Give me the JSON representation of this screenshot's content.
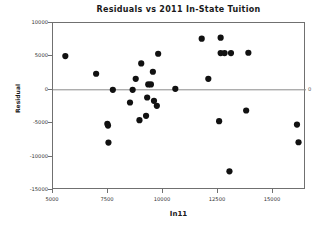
{
  "chart_data": {
    "type": "scatter",
    "title": "Residuals vs 2011 In-State Tuition",
    "xlabel": "In11",
    "ylabel": "Residual",
    "xlim": [
      5000,
      16500
    ],
    "ylim": [
      -15000,
      10000
    ],
    "xticks": [
      5000,
      7500,
      10000,
      12500,
      15000
    ],
    "xtick_labels": [
      "5000",
      "7500",
      "10000",
      "12500",
      "15000"
    ],
    "yticks": [
      10000,
      5000,
      0,
      -5000,
      -10000,
      -15000
    ],
    "ytick_labels": [
      "10000",
      "5000",
      "0",
      "-5000",
      "-10000",
      "-15000"
    ],
    "grid": false,
    "legend": null,
    "reference_line": {
      "orientation": "horizontal",
      "value": 0,
      "label_right": "0",
      "color": "#8a8a8a"
    },
    "marker": {
      "shape": "circle",
      "color": "#111111",
      "size": 3.1
    },
    "points": [
      {
        "x": 5560,
        "y": 5050
      },
      {
        "x": 6960,
        "y": 2400
      },
      {
        "x": 7470,
        "y": -5100
      },
      {
        "x": 7500,
        "y": -5350
      },
      {
        "x": 7520,
        "y": -7900
      },
      {
        "x": 7720,
        "y": 0
      },
      {
        "x": 8500,
        "y": -1900
      },
      {
        "x": 8620,
        "y": 0
      },
      {
        "x": 8760,
        "y": 1650
      },
      {
        "x": 8930,
        "y": -4550
      },
      {
        "x": 9010,
        "y": 3950
      },
      {
        "x": 9230,
        "y": -3900
      },
      {
        "x": 9280,
        "y": -1150
      },
      {
        "x": 9330,
        "y": 800
      },
      {
        "x": 9450,
        "y": 800
      },
      {
        "x": 9540,
        "y": 2700
      },
      {
        "x": 9590,
        "y": -1650
      },
      {
        "x": 9720,
        "y": -2400
      },
      {
        "x": 9780,
        "y": 5400
      },
      {
        "x": 10560,
        "y": 150
      },
      {
        "x": 11760,
        "y": 7650
      },
      {
        "x": 12060,
        "y": 1650
      },
      {
        "x": 12550,
        "y": -4700
      },
      {
        "x": 12620,
        "y": 7800
      },
      {
        "x": 12620,
        "y": 5500
      },
      {
        "x": 12800,
        "y": 5500
      },
      {
        "x": 13020,
        "y": -12200
      },
      {
        "x": 13090,
        "y": 5500
      },
      {
        "x": 13780,
        "y": -3100
      },
      {
        "x": 13880,
        "y": 5550
      },
      {
        "x": 16090,
        "y": -5200
      },
      {
        "x": 16160,
        "y": -7850
      }
    ]
  }
}
